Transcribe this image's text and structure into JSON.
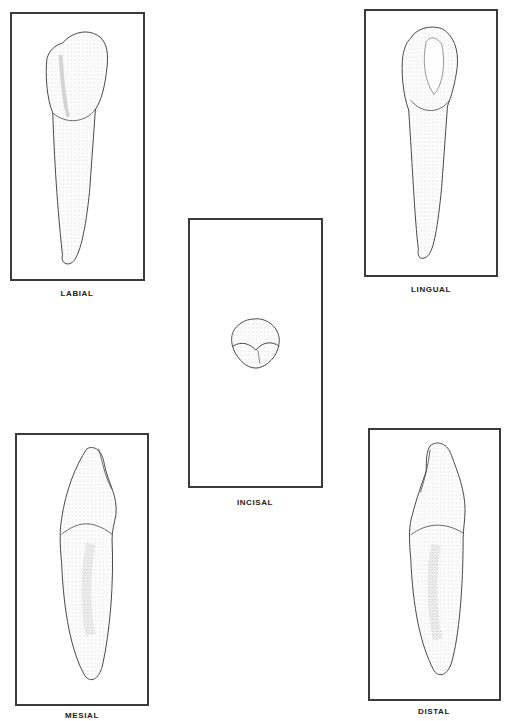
{
  "figure": {
    "views": [
      {
        "id": "labial",
        "label": "LABIAL"
      },
      {
        "id": "lingual",
        "label": "LINGUAL"
      },
      {
        "id": "incisal",
        "label": "INCISAL"
      },
      {
        "id": "mesial",
        "label": "MESIAL"
      },
      {
        "id": "distal",
        "label": "DISTAL"
      }
    ]
  },
  "colors": {
    "frame": "#3a3a3a",
    "outline": "#444444",
    "stipple": "#8a8a8a",
    "background": "#ffffff"
  }
}
